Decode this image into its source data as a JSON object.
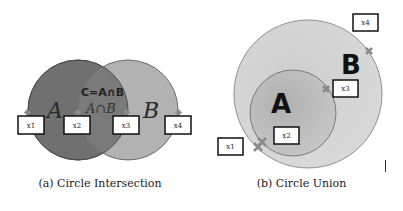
{
  "figure": {
    "panels": [
      {
        "id": "a",
        "caption": "(a) Circle Intersection",
        "circle_a_label": "A",
        "circle_b_label": "B",
        "intersection_title": "C=A∩B",
        "intersection_label": "A∩B",
        "boxes": [
          "x1",
          "x2",
          "x3",
          "x4"
        ]
      },
      {
        "id": "b",
        "caption": "(b) Circle Union",
        "circle_a_label": "A",
        "circle_b_label": "B",
        "boxes": [
          "x1",
          "x2",
          "x3",
          "x4"
        ]
      }
    ],
    "colors": {
      "circle_a_dark": "#6e6e6e",
      "circle_b_light": "#b4b4b4",
      "intersection": "#7c7c7c",
      "union_outer": "#d2d2d2",
      "union_inner": "#bdbdbd",
      "marker": "#8a8a8a"
    }
  }
}
